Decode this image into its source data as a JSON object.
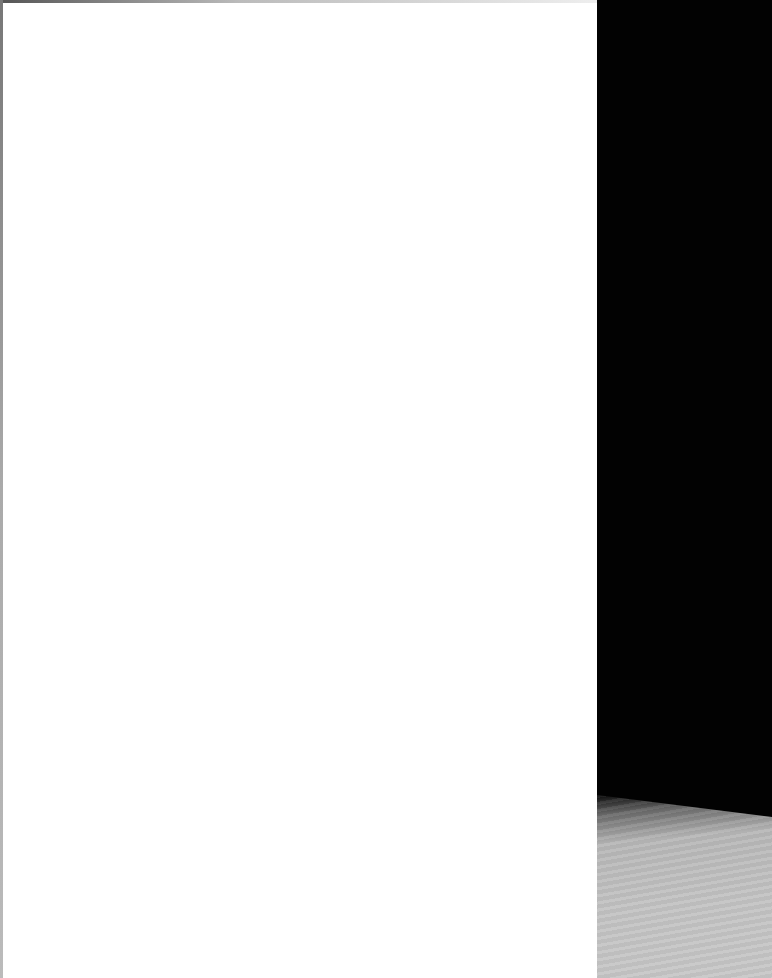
{
  "document": {
    "description": "blank scanned page",
    "page_color": "#ffffff",
    "text": ""
  },
  "background": {
    "backdrop_color": "#000000",
    "surface_color": "#c4c4c4"
  }
}
